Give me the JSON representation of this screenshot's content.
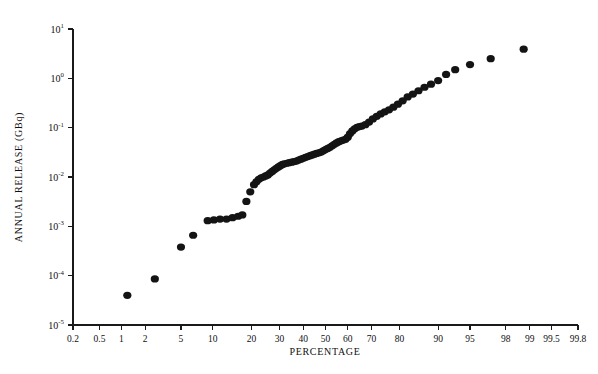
{
  "chart_data": {
    "type": "scatter",
    "title": "",
    "subtitle": "",
    "xlabel": "PERCENTAGE",
    "ylabel": "ANNUAL RELEASE (GBq)",
    "x_scale": "probability",
    "y_scale": "log10",
    "grid": false,
    "legend": null,
    "xlim": [
      0.2,
      99.8
    ],
    "ylim": [
      1e-05,
      10
    ],
    "x_tick_labels": [
      "0.2",
      "0.5",
      "1",
      "2",
      "5",
      "10",
      "20",
      "30",
      "40",
      "50",
      "60",
      "70",
      "80",
      "90",
      "95",
      "98",
      "99",
      "99.5",
      "99.8"
    ],
    "x_tick_values": [
      0.2,
      0.5,
      1,
      2,
      5,
      10,
      20,
      30,
      40,
      50,
      60,
      70,
      80,
      90,
      95,
      98,
      99,
      99.5,
      99.8
    ],
    "y_tick_labels": [
      "10¹",
      "10⁰",
      "10⁻¹",
      "10⁻²",
      "10⁻³",
      "10⁻⁴",
      "10⁻⁵"
    ],
    "y_tick_mantissas": [
      "10",
      "10",
      "10",
      "10",
      "10",
      "10",
      "10"
    ],
    "y_tick_exponents": [
      "1",
      "0",
      "-1",
      "-2",
      "-3",
      "-4",
      "-5"
    ],
    "y_tick_values": [
      10,
      1,
      0.1,
      0.01,
      0.001,
      0.0001,
      1e-05
    ],
    "marker": "filled-circle",
    "marker_color": "#141414",
    "marker_size_px": 4.1,
    "axis_color": "#1a1a1a",
    "background_color": "#ffffff",
    "n_points": 84,
    "points": [
      [
        1.2,
        4e-05
      ],
      [
        2.6,
        8.6e-05
      ],
      [
        5.0,
        0.00038
      ],
      [
        6.6,
        0.00066
      ],
      [
        9.0,
        0.0013
      ],
      [
        10.2,
        0.00135
      ],
      [
        11.5,
        0.0014
      ],
      [
        13.0,
        0.0014
      ],
      [
        14.5,
        0.0015
      ],
      [
        16.0,
        0.0016
      ],
      [
        17.2,
        0.0017
      ],
      [
        18.4,
        0.0032
      ],
      [
        19.6,
        0.005
      ],
      [
        20.8,
        0.007
      ],
      [
        21.6,
        0.008
      ],
      [
        22.4,
        0.009
      ],
      [
        23.2,
        0.0096
      ],
      [
        24.0,
        0.01
      ],
      [
        24.8,
        0.0105
      ],
      [
        25.6,
        0.011
      ],
      [
        26.4,
        0.012
      ],
      [
        27.2,
        0.013
      ],
      [
        28.0,
        0.014
      ],
      [
        28.8,
        0.015
      ],
      [
        29.6,
        0.016
      ],
      [
        30.4,
        0.017
      ],
      [
        31.2,
        0.018
      ],
      [
        32.0,
        0.0185
      ],
      [
        33.0,
        0.019
      ],
      [
        34.0,
        0.0195
      ],
      [
        35.0,
        0.02
      ],
      [
        36.0,
        0.0205
      ],
      [
        37.0,
        0.021
      ],
      [
        38.0,
        0.022
      ],
      [
        39.0,
        0.023
      ],
      [
        40.0,
        0.024
      ],
      [
        41.0,
        0.025
      ],
      [
        42.0,
        0.026
      ],
      [
        43.0,
        0.027
      ],
      [
        44.0,
        0.028
      ],
      [
        45.0,
        0.029
      ],
      [
        46.0,
        0.03
      ],
      [
        47.0,
        0.031
      ],
      [
        48.0,
        0.032
      ],
      [
        49.0,
        0.034
      ],
      [
        50.0,
        0.036
      ],
      [
        51.0,
        0.038
      ],
      [
        52.0,
        0.04
      ],
      [
        53.0,
        0.043
      ],
      [
        54.0,
        0.046
      ],
      [
        55.0,
        0.049
      ],
      [
        56.0,
        0.052
      ],
      [
        57.0,
        0.054
      ],
      [
        58.0,
        0.056
      ],
      [
        59.0,
        0.058
      ],
      [
        60.0,
        0.064
      ],
      [
        61.0,
        0.076
      ],
      [
        62.0,
        0.086
      ],
      [
        63.0,
        0.095
      ],
      [
        64.0,
        0.102
      ],
      [
        65.0,
        0.105
      ],
      [
        66.0,
        0.108
      ],
      [
        67.5,
        0.115
      ],
      [
        69.0,
        0.13
      ],
      [
        70.5,
        0.15
      ],
      [
        72.0,
        0.17
      ],
      [
        73.5,
        0.19
      ],
      [
        75.0,
        0.21
      ],
      [
        76.5,
        0.23
      ],
      [
        78.0,
        0.26
      ],
      [
        79.5,
        0.3
      ],
      [
        81.0,
        0.35
      ],
      [
        82.5,
        0.42
      ],
      [
        84.0,
        0.48
      ],
      [
        85.5,
        0.56
      ],
      [
        87.0,
        0.66
      ],
      [
        88.5,
        0.76
      ],
      [
        90.0,
        0.9
      ],
      [
        91.5,
        1.2
      ],
      [
        93.0,
        1.5
      ],
      [
        95.0,
        1.9
      ],
      [
        97.0,
        2.5
      ],
      [
        98.8,
        3.9
      ]
    ]
  },
  "figure": {
    "x_axis_label": "PERCENTAGE",
    "y_axis_label": "ANNUAL RELEASE (GBq)"
  }
}
